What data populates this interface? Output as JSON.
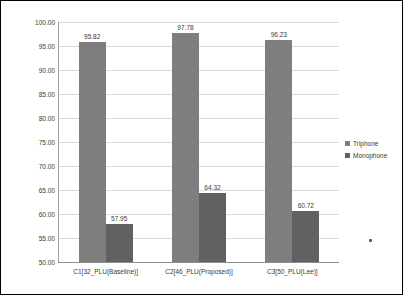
{
  "chart_data": {
    "type": "bar",
    "title": "",
    "xlabel": "",
    "ylabel": "",
    "categories": [
      "C1[32_PLU(Baseline)]",
      "C2[46_PLU(Proposed)]",
      "C3[50_PLU(Lee)]"
    ],
    "series": [
      {
        "name": "Triphone",
        "values": [
          95.82,
          97.78,
          96.23
        ],
        "color": "#7e7e7e"
      },
      {
        "name": "Monophone",
        "values": [
          57.95,
          64.32,
          60.72
        ],
        "color": "#616161"
      }
    ],
    "ylim": [
      50,
      100
    ],
    "ytick_step": 5,
    "ytick_decimals": 2,
    "value_labels": true,
    "grid": true,
    "legend_position": "right"
  },
  "styles": {
    "background": "#ffffff",
    "frame_border": "#000000",
    "gridline_color": "#d9d9d9",
    "axis_color": "#9e9e9e",
    "text_color": "#3a3a3a"
  }
}
